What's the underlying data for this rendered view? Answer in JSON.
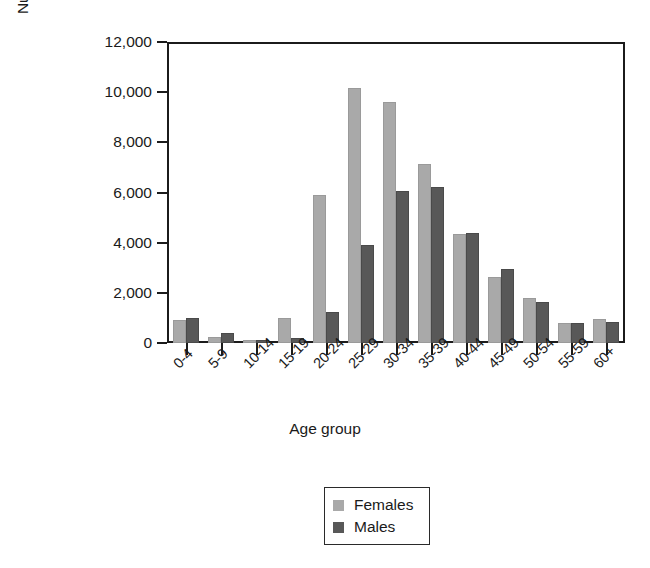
{
  "chart_data": {
    "type": "bar",
    "title": "",
    "xlabel": "Age group",
    "ylabel": "Number of cases,1986-2003",
    "categories": [
      "0-4",
      "5-9",
      "10-14",
      "15-19",
      "20-24",
      "25-29",
      "30-34",
      "35-39",
      "40-44",
      "45-49",
      "50-54",
      "55-59",
      "60+"
    ],
    "series": [
      {
        "name": "Females",
        "color": "#a9a9a9",
        "values": [
          900,
          250,
          130,
          1000,
          5900,
          10150,
          9600,
          7150,
          4350,
          2650,
          1800,
          780,
          950
        ]
      },
      {
        "name": "Males",
        "color": "#585858",
        "values": [
          980,
          380,
          120,
          200,
          1250,
          3900,
          6050,
          6200,
          4400,
          2950,
          1650,
          780,
          830
        ]
      }
    ],
    "ylim": [
      0,
      12000
    ],
    "ytick_values": [
      0,
      2000,
      4000,
      6000,
      8000,
      10000,
      12000
    ],
    "ytick_labels": [
      "0",
      "2,000",
      "4,000",
      "6,000",
      "8,000",
      "10,000",
      "12,000"
    ],
    "grid": false,
    "legend_position": "bottom-center",
    "legend_entries": [
      "Females",
      "Males"
    ],
    "axis_color": "#1b1b1b",
    "background": "#ffffff"
  }
}
